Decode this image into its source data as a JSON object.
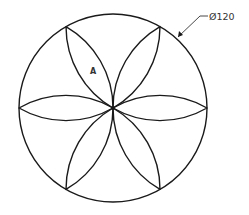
{
  "drawing": {
    "type": "technical-drawing",
    "subject": "six-petal rosette inscribed in circle",
    "petal_count": 6,
    "dimension": {
      "text": "Ø120",
      "kind": "diameter"
    },
    "region_label": "A",
    "colors": {
      "line": "#1a1a1a",
      "background": "#ffffff"
    }
  }
}
